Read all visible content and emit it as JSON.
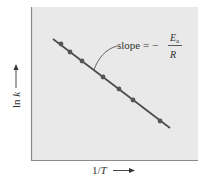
{
  "chart_data": {
    "type": "line",
    "title": "",
    "xlabel": "1/T",
    "ylabel": "ln k",
    "xlabel_arrow": "⟶",
    "ylabel_arrow": "⟶",
    "grid": false,
    "legend": null,
    "axis_ticks": "none (qualitative)",
    "annotation": {
      "text": "slope = −",
      "fraction_numerator": "E",
      "fraction_numerator_sub": "a",
      "fraction_denominator": "R"
    },
    "points_px": [
      [
        61,
        44
      ],
      [
        70,
        52
      ],
      [
        82,
        61
      ],
      [
        103,
        77
      ],
      [
        119,
        89
      ],
      [
        133,
        100
      ],
      [
        160,
        121
      ]
    ],
    "line_px": [
      [
        53,
        39
      ],
      [
        170,
        128
      ]
    ],
    "colors": {
      "background": "#e9e9e9",
      "line": "#4a4a4a",
      "marker": "#555555",
      "axis": "#8a8a8a",
      "text": "#333333"
    }
  }
}
